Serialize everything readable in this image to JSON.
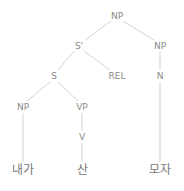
{
  "tree": {
    "nodes": [
      {
        "id": "np_root",
        "label": "NP",
        "x": 117,
        "y": 16
      },
      {
        "id": "s_bar",
        "label": "S'",
        "x": 79,
        "y": 46
      },
      {
        "id": "np_right",
        "label": "NP",
        "x": 160,
        "y": 46
      },
      {
        "id": "s",
        "label": "S",
        "x": 54,
        "y": 76
      },
      {
        "id": "rel",
        "label": "REL",
        "x": 117,
        "y": 76
      },
      {
        "id": "n",
        "label": "N",
        "x": 160,
        "y": 76
      },
      {
        "id": "np_left",
        "label": "NP",
        "x": 23,
        "y": 107
      },
      {
        "id": "vp",
        "label": "VP",
        "x": 82,
        "y": 107
      },
      {
        "id": "v",
        "label": "V",
        "x": 82,
        "y": 137
      },
      {
        "id": "word_naega",
        "label": "내가",
        "x": 23,
        "y": 170
      },
      {
        "id": "word_san",
        "label": "산",
        "x": 82,
        "y": 170
      },
      {
        "id": "word_moja",
        "label": "모자",
        "x": 160,
        "y": 170
      }
    ],
    "edges": [
      [
        "np_root",
        "s_bar"
      ],
      [
        "np_root",
        "np_right"
      ],
      [
        "s_bar",
        "s"
      ],
      [
        "s_bar",
        "rel"
      ],
      [
        "np_right",
        "n"
      ],
      [
        "s",
        "np_left"
      ],
      [
        "s",
        "vp"
      ],
      [
        "vp",
        "v"
      ],
      [
        "np_left",
        "word_naega"
      ],
      [
        "v",
        "word_san"
      ],
      [
        "n",
        "word_moja"
      ]
    ],
    "line_color": "#c8c8c8",
    "label_color": "#8a8a8a"
  }
}
